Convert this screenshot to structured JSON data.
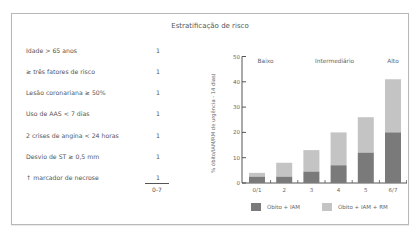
{
  "title": "Estratificação de risco",
  "risk_table": {
    "rows": [
      {
        "label": "Idade > 65 anos",
        "points": "1"
      },
      {
        "label": "≥ três fatores de risco",
        "points": "1"
      },
      {
        "label": "Lesão coronariana ≥ 50%",
        "points": "1"
      },
      {
        "label": "Uso de AAS < 7 dias",
        "points": "1"
      },
      {
        "label": "2 crises de angina < 24 horas",
        "points": "1"
      },
      {
        "label": "Desvio de ST ≥ 0,5 mm",
        "points": "1"
      },
      {
        "label": "↑ marcador de necrose",
        "points": "1"
      }
    ],
    "total_range": "0-7"
  },
  "colors": {
    "dark_series": "#7a7a7a",
    "light_series": "#c4c4c4",
    "axis": "#555555"
  },
  "chart_data": {
    "type": "bar",
    "stacked": true,
    "title": "",
    "xlabel": "",
    "ylabel": "% óbito/IAM/RM de urgência - 14 dias)",
    "ylim": [
      0,
      50
    ],
    "yticks": [
      0,
      10,
      20,
      30,
      40,
      50
    ],
    "grid": false,
    "categories": [
      "0/1",
      "2",
      "3",
      "4",
      "5",
      "6/7"
    ],
    "series": [
      {
        "name": "Óbito + IAM",
        "values": [
          2.5,
          2.5,
          4.5,
          7,
          12,
          20
        ]
      },
      {
        "name": "Óbito + IAM + RM",
        "values": [
          4,
          8,
          13,
          20,
          26,
          41
        ]
      }
    ],
    "series_note": "Óbito + IAM + RM is the total bar height (light), Óbito + IAM is the dark lower portion",
    "annotations": [
      {
        "text": "Baixo",
        "over": [
          "0/1",
          "2"
        ]
      },
      {
        "text": "Intermediário",
        "over": [
          "3",
          "4",
          "5"
        ]
      },
      {
        "text": "Alto",
        "over": [
          "6/7"
        ]
      }
    ],
    "legend": {
      "position": "bottom",
      "entries": [
        "Óbito + IAM",
        "Óbito + IAM + RM"
      ]
    }
  }
}
